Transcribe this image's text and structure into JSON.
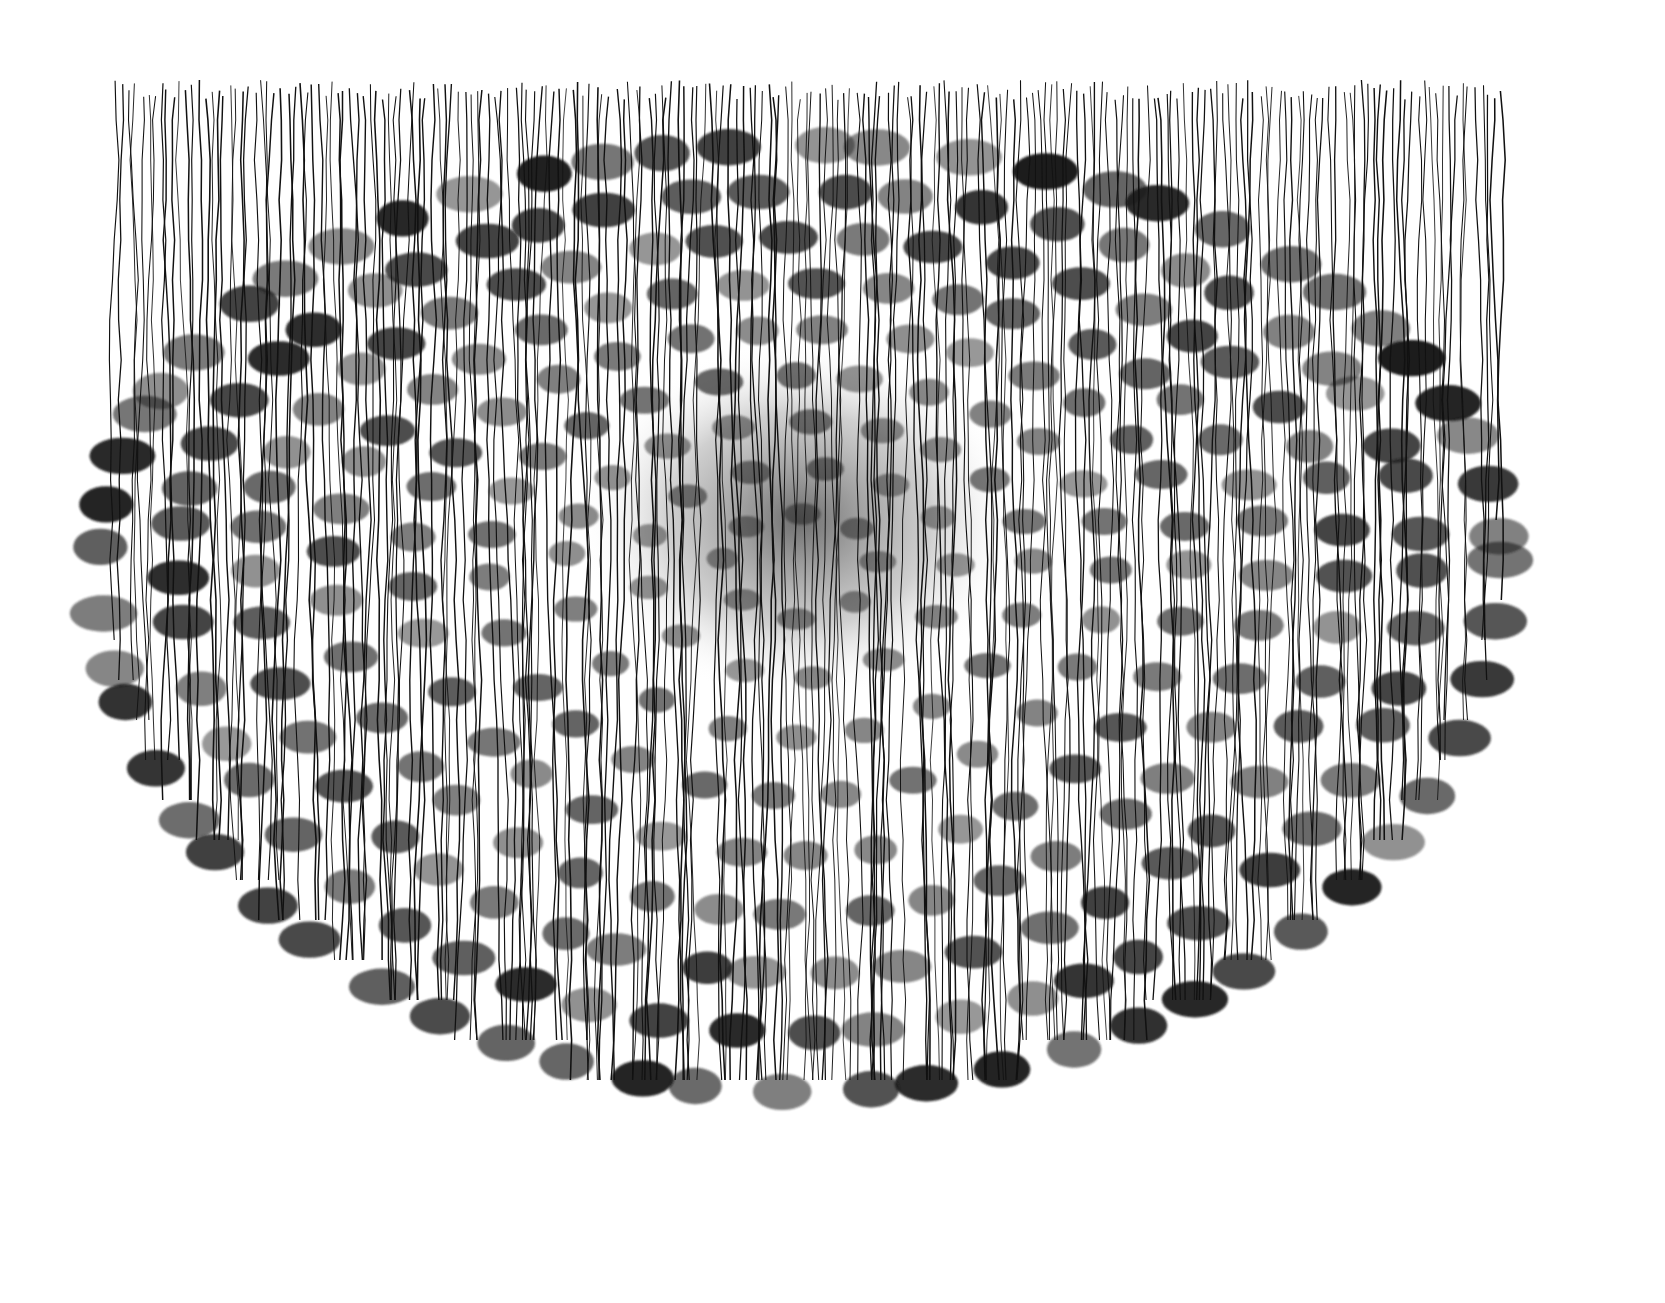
{
  "artwork": {
    "description": "Ink drawing of concentric elliptical rings of dark cell bodies with dense vertical fibers descending through them",
    "background": "#ffffff",
    "ink": "#111111",
    "cell_color": "#1a1a1a",
    "center_shade": "#555555",
    "ellipse": {
      "cx": 800,
      "cy": 560,
      "rx": 700,
      "ry": 560
    },
    "fiber_top": 80,
    "fiber_count": 220,
    "rings": 9
  }
}
